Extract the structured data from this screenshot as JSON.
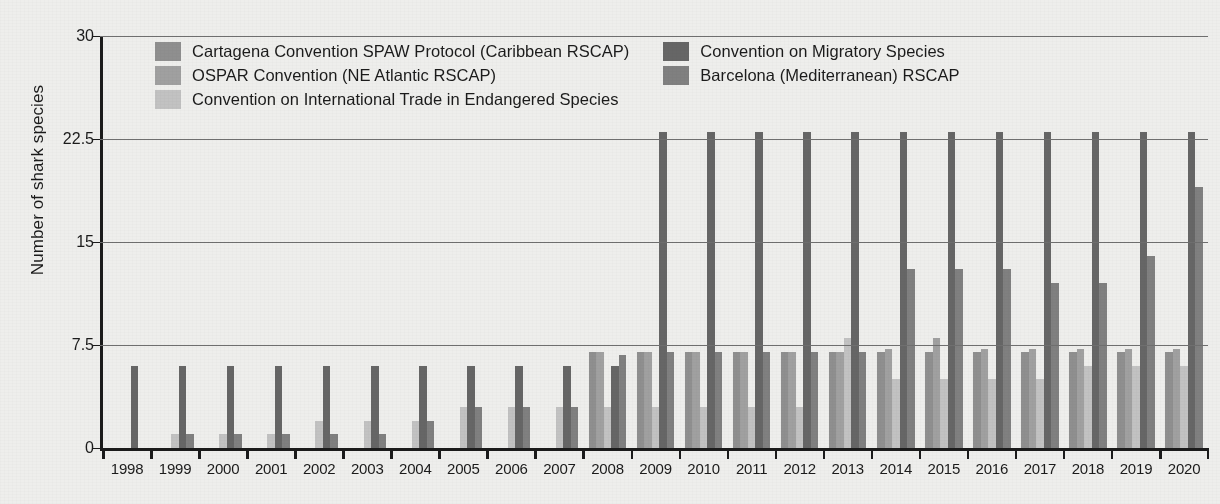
{
  "chart_data": {
    "type": "bar",
    "title": "",
    "xlabel": "",
    "ylabel": "Number of shark species",
    "ylim": [
      0,
      30
    ],
    "yticks": [
      "0",
      "7.5",
      "15",
      "22.5",
      "30"
    ],
    "ytick_values": [
      0,
      7.5,
      15,
      22.5,
      30
    ],
    "grid": "horizontal",
    "legend_position": "top-inside",
    "orientation": "vertical",
    "grouping": "grouped",
    "categories": [
      "1998",
      "1999",
      "2000",
      "2001",
      "2002",
      "2003",
      "2004",
      "2005",
      "2006",
      "2007",
      "2008",
      "2009",
      "2010",
      "2011",
      "2012",
      "2013",
      "2014",
      "2015",
      "2016",
      "2017",
      "2018",
      "2019",
      "2020"
    ],
    "series": [
      {
        "name": "Cartagena Convention SPAW Protocol (Caribbean RSCAP)",
        "color": "#8f8f8f",
        "values": [
          0,
          0,
          0,
          0,
          0,
          0,
          0,
          0,
          0,
          0,
          7,
          7,
          7,
          7,
          7,
          7,
          7,
          7,
          7,
          7,
          7,
          7,
          7
        ]
      },
      {
        "name": "OSPAR Convention (NE Atlantic RSCAP)",
        "color": "#a0a0a0",
        "values": [
          0,
          0,
          0,
          0,
          0,
          0,
          0,
          0,
          0,
          0,
          7,
          7,
          7,
          7,
          7,
          7,
          7.2,
          8,
          7.2,
          7.2,
          7.2,
          7.2,
          7.2
        ]
      },
      {
        "name": "Convention on International Trade in Endangered Species",
        "color": "#c2c2c2",
        "values": [
          0,
          1,
          1,
          1,
          2,
          2,
          2,
          3,
          3,
          3,
          3,
          3,
          3,
          3,
          3,
          8,
          5,
          5,
          5,
          5,
          6,
          6,
          6
        ]
      },
      {
        "name": "Convention on Migratory Species",
        "color": "#666666",
        "values": [
          6,
          6,
          6,
          6,
          6,
          6,
          6,
          6,
          6,
          6,
          6,
          23,
          23,
          23,
          23,
          23,
          23,
          23,
          23,
          23,
          23,
          23,
          23
        ]
      },
      {
        "name": "Barcelona (Mediterranean) RSCAP",
        "color": "#808080",
        "values": [
          0,
          1,
          1,
          1,
          1,
          1,
          2,
          3,
          3,
          3,
          6.8,
          7,
          7,
          7,
          7,
          7,
          13,
          13,
          13,
          12,
          12,
          14,
          19
        ]
      }
    ]
  },
  "legend": {
    "columns": [
      {
        "items": [
          {
            "label": "Cartagena Convention SPAW Protocol (Caribbean RSCAP)",
            "color": "#8f8f8f",
            "icon": "legend-swatch"
          },
          {
            "label": "OSPAR Convention (NE Atlantic RSCAP)",
            "color": "#a0a0a0",
            "icon": "legend-swatch"
          },
          {
            "label": "Convention on International Trade in Endangered Species",
            "color": "#c2c2c2",
            "icon": "legend-swatch"
          }
        ]
      },
      {
        "items": [
          {
            "label": "Convention on Migratory Species",
            "color": "#666666",
            "icon": "legend-swatch"
          },
          {
            "label": "Barcelona (Mediterranean) RSCAP",
            "color": "#808080",
            "icon": "legend-swatch"
          }
        ]
      }
    ]
  },
  "colors": {
    "background": "#eeeeec",
    "axis": "#1b1b1b",
    "grid": "#6f6f6f",
    "text": "#1b1b1b"
  }
}
